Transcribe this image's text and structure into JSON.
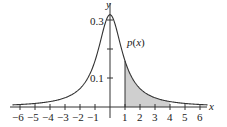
{
  "chart_data": {
    "type": "area",
    "title": "",
    "function_label": "p(x)",
    "formula": "p(x) = 1/(pi(1+x^2))",
    "xlabel": "x",
    "ylabel": "y",
    "xlim": [
      -6.5,
      6.5
    ],
    "ylim": [
      0,
      0.34
    ],
    "x_ticks": [
      -6,
      -5,
      -4,
      -3,
      -2,
      -1,
      1,
      2,
      3,
      4,
      5,
      6
    ],
    "x_tick_labels": [
      "−6",
      "−5",
      "−4",
      "−3",
      "−2",
      "−1",
      "1",
      "2",
      "3",
      "4",
      "5",
      "6"
    ],
    "y_ticks": [
      0.1,
      0.2,
      0.3
    ],
    "y_tick_labels": [
      "0.1",
      "",
      "0.3"
    ],
    "shaded_region": {
      "x_from": 1,
      "x_to": 4
    },
    "series": [
      {
        "name": "p(x)",
        "x": [
          -6,
          -5,
          -4,
          -3,
          -2,
          -1,
          0,
          1,
          2,
          3,
          4,
          5,
          6
        ],
        "values": [
          0.0086,
          0.0122,
          0.0187,
          0.0318,
          0.0637,
          0.1592,
          0.3183,
          0.1592,
          0.0637,
          0.0318,
          0.0187,
          0.0122,
          0.0086
        ]
      }
    ],
    "grid": false,
    "legend": "none"
  },
  "labels": {
    "x_axis": "x",
    "y_axis": "y",
    "curve": "p(x)",
    "y_tick_03": "0.3",
    "y_tick_01": "0.1",
    "x_tick_m6": "−6",
    "x_tick_m5": "−5",
    "x_tick_m4": "−4",
    "x_tick_m3": "−3",
    "x_tick_m2": "−2",
    "x_tick_m1": "−1",
    "x_tick_1": "1",
    "x_tick_2": "2",
    "x_tick_3": "3",
    "x_tick_4": "4",
    "x_tick_5": "5",
    "x_tick_6": "6"
  },
  "colors": {
    "curve": "#333333",
    "shade": "#cfcfcf",
    "axis": "#333333"
  }
}
